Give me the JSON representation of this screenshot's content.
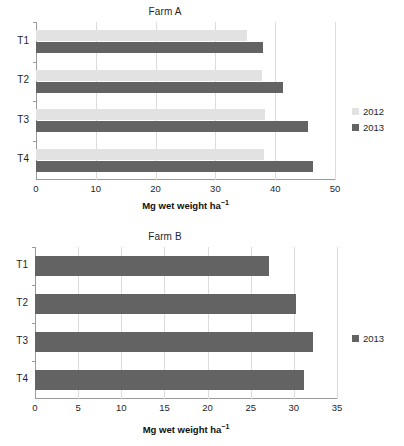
{
  "figure": {
    "panels": [
      {
        "id": "farm-a",
        "title": "Farm A",
        "xlabel_main": "Mg wet weight ha",
        "xlabel_sup": "−1",
        "categories": [
          "T1",
          "T2",
          "T3",
          "T4"
        ],
        "xticks": [
          "0",
          "10",
          "20",
          "30",
          "40",
          "50"
        ],
        "legend": [
          {
            "label": "2012",
            "color": "#e2e2e2"
          },
          {
            "label": "2013",
            "color": "#636363"
          }
        ]
      },
      {
        "id": "farm-b",
        "title": "Farm B",
        "xlabel_main": "Mg wet weight ha",
        "xlabel_sup": "−1",
        "categories": [
          "T1",
          "T2",
          "T3",
          "T4"
        ],
        "xticks": [
          "0",
          "5",
          "10",
          "15",
          "20",
          "25",
          "30",
          "35"
        ],
        "legend": [
          {
            "label": "2013",
            "color": "#636363"
          }
        ]
      }
    ]
  },
  "chart_data": [
    {
      "type": "bar",
      "orientation": "horizontal",
      "title": "Farm A",
      "categories": [
        "T1",
        "T2",
        "T3",
        "T4"
      ],
      "series": [
        {
          "name": "2012",
          "color": "#e2e2e2",
          "values": [
            35.3,
            37.8,
            38.3,
            38.1
          ]
        },
        {
          "name": "2013",
          "color": "#636363",
          "values": [
            38.0,
            41.3,
            45.5,
            46.3
          ]
        }
      ],
      "xlabel": "Mg wet weight ha−1",
      "ylabel": "",
      "xlim": [
        0,
        50
      ],
      "xticks": [
        0,
        10,
        20,
        30,
        40,
        50
      ],
      "grid": true,
      "legend_position": "right"
    },
    {
      "type": "bar",
      "orientation": "horizontal",
      "title": "Farm B",
      "categories": [
        "T1",
        "T2",
        "T3",
        "T4"
      ],
      "series": [
        {
          "name": "2013",
          "color": "#636363",
          "values": [
            27.1,
            30.2,
            32.2,
            31.2
          ]
        }
      ],
      "xlabel": "Mg wet weight ha−1",
      "ylabel": "",
      "xlim": [
        0,
        35
      ],
      "xticks": [
        0,
        5,
        10,
        15,
        20,
        25,
        30,
        35
      ],
      "grid": true,
      "legend_position": "right"
    }
  ]
}
